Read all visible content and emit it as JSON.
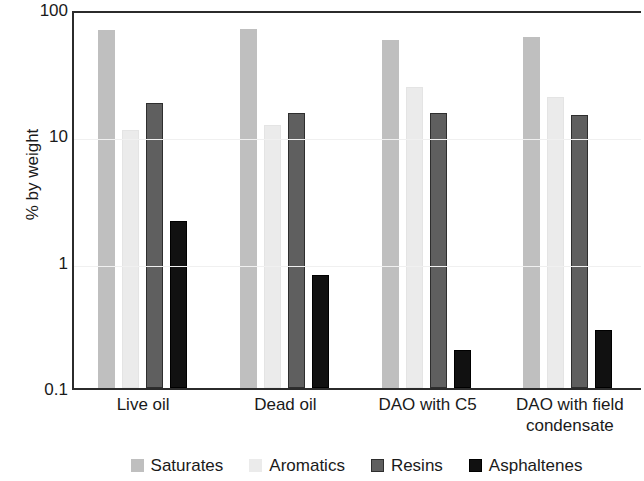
{
  "chart_data": {
    "type": "bar",
    "title": "",
    "subtitle": "",
    "xlabel": "",
    "ylabel": "% by weight",
    "yscale": "log",
    "ylim": [
      0.1,
      100
    ],
    "ytick_labels": [
      "100",
      "10",
      "1",
      "0.1"
    ],
    "ytick_values": [
      100,
      10,
      1,
      0.1
    ],
    "grid": true,
    "legend_position": "bottom",
    "categories": [
      "Live oil",
      "Dead oil",
      "DAO with C5",
      "DAO with field condensate"
    ],
    "series": [
      {
        "name": "Saturates",
        "color": "#bfbfbf",
        "values": [
          68,
          70,
          57,
          60
        ]
      },
      {
        "name": "Aromatics",
        "color": "#ebebeb",
        "values": [
          11,
          12,
          24,
          20
        ]
      },
      {
        "name": "Resins",
        "color": "#5f5f5f",
        "values": [
          18,
          15,
          15,
          14.5
        ]
      },
      {
        "name": "Asphaltenes",
        "color": "#111111",
        "values": [
          2.1,
          0.79,
          0.2,
          0.29
        ]
      }
    ]
  }
}
